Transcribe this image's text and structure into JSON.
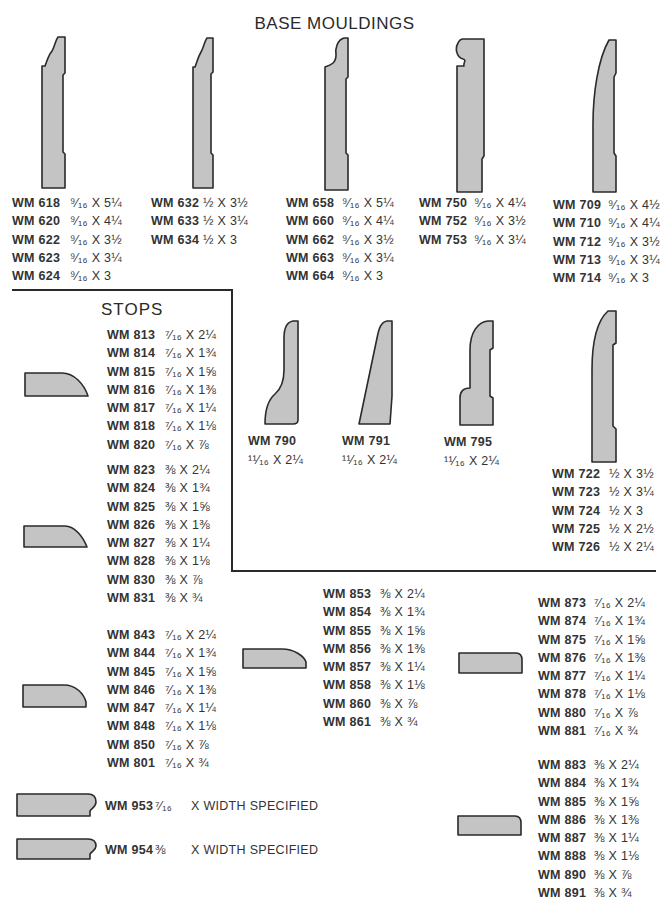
{
  "title": "BASE MOULDINGS",
  "stops_title": "STOPS",
  "base_groups": [
    {
      "items": [
        {
          "code": "WM 618",
          "size": "⁹⁄₁₆ X 5¼"
        },
        {
          "code": "WM 620",
          "size": "⁹⁄₁₆ X 4¼"
        },
        {
          "code": "WM 622",
          "size": "⁹⁄₁₆ X 3½"
        },
        {
          "code": "WM 623",
          "size": "⁹⁄₁₆ X 3¼"
        },
        {
          "code": "WM 624",
          "size": "⁹⁄₁₆ X 3"
        }
      ]
    },
    {
      "items": [
        {
          "code": "WM 632",
          "size": "½ X 3½"
        },
        {
          "code": "WM 633",
          "size": "½ X 3¼"
        },
        {
          "code": "WM 634",
          "size": "½ X 3"
        }
      ]
    },
    {
      "items": [
        {
          "code": "WM 658",
          "size": "⁹⁄₁₆ X 5¼"
        },
        {
          "code": "WM 660",
          "size": "⁹⁄₁₆ X 4¼"
        },
        {
          "code": "WM 662",
          "size": "⁹⁄₁₆ X 3½"
        },
        {
          "code": "WM 663",
          "size": "⁹⁄₁₆ X 3¼"
        },
        {
          "code": "WM 664",
          "size": "⁹⁄₁₆ X 3"
        }
      ]
    },
    {
      "items": [
        {
          "code": "WM 750",
          "size": "⁹⁄₁₆ X 4¼"
        },
        {
          "code": "WM 752",
          "size": "⁹⁄₁₆ X 3½"
        },
        {
          "code": "WM 753",
          "size": "⁹⁄₁₆ X 3¼"
        }
      ]
    },
    {
      "items": [
        {
          "code": "WM 709",
          "size": "⁹⁄₁₆ X 4½"
        },
        {
          "code": "WM 710",
          "size": "⁹⁄₁₆ X 4¼"
        },
        {
          "code": "WM 712",
          "size": "⁹⁄₁₆ X 3½"
        },
        {
          "code": "WM 713",
          "size": "⁹⁄₁₆ X 3¼"
        },
        {
          "code": "WM 714",
          "size": "⁹⁄₁₆ X 3"
        }
      ]
    }
  ],
  "mid_base": [
    {
      "code": "WM 790",
      "size": "¹¹⁄₁₆ X 2¼"
    },
    {
      "code": "WM 791",
      "size": "¹¹⁄₁₆ X 2¼"
    },
    {
      "code": "WM 795",
      "size": "¹¹⁄₁₆ X 2¼"
    }
  ],
  "group_722": {
    "items": [
      {
        "code": "WM 722",
        "size": "½ X 3½"
      },
      {
        "code": "WM 723",
        "size": "½ X 3¼"
      },
      {
        "code": "WM 724",
        "size": "½ X 3"
      },
      {
        "code": "WM 725",
        "size": "½ X 2½"
      },
      {
        "code": "WM 726",
        "size": "½ X 2¼"
      }
    ]
  },
  "stop_groups": [
    {
      "items": [
        {
          "code": "WM 813",
          "size": "⁷⁄₁₆ X 2¼"
        },
        {
          "code": "WM 814",
          "size": "⁷⁄₁₆ X 1¾"
        },
        {
          "code": "WM 815",
          "size": "⁷⁄₁₆ X 1⅝"
        },
        {
          "code": "WM 816",
          "size": "⁷⁄₁₆ X 1⅜"
        },
        {
          "code": "WM 817",
          "size": "⁷⁄₁₆ X 1¼"
        },
        {
          "code": "WM 818",
          "size": "⁷⁄₁₆ X 1⅛"
        },
        {
          "code": "WM 820",
          "size": "⁷⁄₁₆ X ⅞"
        }
      ]
    },
    {
      "items": [
        {
          "code": "WM 823",
          "size": "⅜ X 2¼"
        },
        {
          "code": "WM 824",
          "size": "⅜ X 1¾"
        },
        {
          "code": "WM 825",
          "size": "⅜ X 1⅝"
        },
        {
          "code": "WM 826",
          "size": "⅜ X 1⅜"
        },
        {
          "code": "WM 827",
          "size": "⅜ X 1¼"
        },
        {
          "code": "WM 828",
          "size": "⅜ X 1⅛"
        },
        {
          "code": "WM 830",
          "size": "⅜ X ⅞"
        },
        {
          "code": "WM 831",
          "size": "⅜ X ¾"
        }
      ]
    },
    {
      "items": [
        {
          "code": "WM 843",
          "size": "⁷⁄₁₆ X 2¼"
        },
        {
          "code": "WM 844",
          "size": "⁷⁄₁₆ X 1¾"
        },
        {
          "code": "WM 845",
          "size": "⁷⁄₁₆ X 1⅝"
        },
        {
          "code": "WM 846",
          "size": "⁷⁄₁₆ X 1⅜"
        },
        {
          "code": "WM 847",
          "size": "⁷⁄₁₆ X 1¼"
        },
        {
          "code": "WM 848",
          "size": "⁷⁄₁₆ X 1⅛"
        },
        {
          "code": "WM 850",
          "size": "⁷⁄₁₆ X ⅞"
        },
        {
          "code": "WM 801",
          "size": "⁷⁄₁₆ X ¾"
        }
      ]
    },
    {
      "items": [
        {
          "code": "WM 853",
          "size": "⅜ X 2¼"
        },
        {
          "code": "WM 854",
          "size": "⅜ X 1¾"
        },
        {
          "code": "WM 855",
          "size": "⅜ X 1⅝"
        },
        {
          "code": "WM 856",
          "size": "⅜ X 1⅜"
        },
        {
          "code": "WM 857",
          "size": "⅜ X 1¼"
        },
        {
          "code": "WM 858",
          "size": "⅜ X 1⅛"
        },
        {
          "code": "WM 860",
          "size": "⅜ X ⅞"
        },
        {
          "code": "WM 861",
          "size": "⅜ X ¾"
        }
      ]
    },
    {
      "items": [
        {
          "code": "WM 873",
          "size": "⁷⁄₁₆ X 2¼"
        },
        {
          "code": "WM 874",
          "size": "⁷⁄₁₆ X 1¾"
        },
        {
          "code": "WM 875",
          "size": "⁷⁄₁₆ X 1⅝"
        },
        {
          "code": "WM 876",
          "size": "⁷⁄₁₆ X 1⅜"
        },
        {
          "code": "WM 877",
          "size": "⁷⁄₁₆ X 1¼"
        },
        {
          "code": "WM 878",
          "size": "⁷⁄₁₆ X 1⅛"
        },
        {
          "code": "WM 880",
          "size": "⁷⁄₁₆ X ⅞"
        },
        {
          "code": "WM 881",
          "size": "⁷⁄₁₆ X ¾"
        }
      ]
    },
    {
      "items": [
        {
          "code": "WM 883",
          "size": "⅜ X 2¼"
        },
        {
          "code": "WM 884",
          "size": "⅜ X 1¾"
        },
        {
          "code": "WM 885",
          "size": "⅜ X 1⅝"
        },
        {
          "code": "WM 886",
          "size": "⅜ X 1⅜"
        },
        {
          "code": "WM 887",
          "size": "⅜ X 1¼"
        },
        {
          "code": "WM 888",
          "size": "⅜ X 1⅛"
        },
        {
          "code": "WM 890",
          "size": "⅜ X ⅞"
        },
        {
          "code": "WM 891",
          "size": "⅜ X ¾"
        }
      ]
    }
  ],
  "width_specified": [
    {
      "code": "WM 953",
      "size": "⁷⁄₁₆",
      "note": "X WIDTH SPECIFIED"
    },
    {
      "code": "WM 954",
      "size": "⅜",
      "note": "X WIDTH SPECIFIED"
    }
  ]
}
